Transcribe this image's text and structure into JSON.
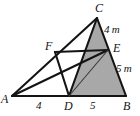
{
  "figure": {
    "type": "geometry-diagram",
    "shape": "triangle-with-cevians",
    "background_color": "#ffffff",
    "stroke_color": "#141414",
    "shaded_fill_color": "#a8a8a8",
    "vertices": [
      {
        "name": "A",
        "label": "A",
        "x": 12,
        "y": 96
      },
      {
        "name": "B",
        "label": "B",
        "x": 126,
        "y": 96
      },
      {
        "name": "C",
        "label": "C",
        "x": 97,
        "y": 18
      },
      {
        "name": "D",
        "label": "D",
        "x": 69,
        "y": 96
      },
      {
        "name": "E",
        "label": "E",
        "x": 108,
        "y": 50
      },
      {
        "name": "F",
        "label": "F",
        "x": 55,
        "y": 52
      }
    ],
    "vertex_labels": [
      {
        "name": "label-C",
        "text": "C",
        "x": 95,
        "y": 2
      },
      {
        "name": "label-F",
        "text": "F",
        "x": 45,
        "y": 40
      },
      {
        "name": "label-E",
        "text": "E",
        "x": 113,
        "y": 42
      },
      {
        "name": "label-A",
        "text": "A",
        "x": 1,
        "y": 93
      },
      {
        "name": "label-D",
        "text": "D",
        "x": 64,
        "y": 100
      },
      {
        "name": "label-B",
        "text": "B",
        "x": 123,
        "y": 100
      }
    ],
    "measure_labels": [
      {
        "name": "label-4m",
        "text": "4 m",
        "x": 104,
        "y": 24
      },
      {
        "name": "label-5m",
        "text": "5 m",
        "x": 116,
        "y": 63
      }
    ],
    "length_labels": [
      {
        "name": "label-segment-AD",
        "text": "4",
        "x": 36,
        "y": 100
      },
      {
        "name": "label-segment-DB",
        "text": "5",
        "x": 90,
        "y": 100
      }
    ],
    "segments": [
      {
        "name": "segment-AB",
        "from": "A",
        "to": "B",
        "weight": "thick"
      },
      {
        "name": "segment-AC",
        "from": "A",
        "to": "C",
        "weight": "thick"
      },
      {
        "name": "segment-CB",
        "from": "C",
        "to": "B",
        "weight": "thick"
      },
      {
        "name": "segment-DC",
        "from": "D",
        "to": "C",
        "weight": "thick"
      },
      {
        "name": "segment-AE",
        "from": "A",
        "to": "E",
        "weight": "thick"
      },
      {
        "name": "segment-FE",
        "from": "F",
        "to": "E",
        "weight": "thick"
      },
      {
        "name": "segment-FD",
        "from": "F",
        "to": "D",
        "weight": "thick"
      },
      {
        "name": "segment-DE",
        "from": "D",
        "to": "E",
        "weight": "thin"
      }
    ],
    "shaded_regions": [
      {
        "name": "region-DCB",
        "polygon": "D,C,B"
      }
    ]
  }
}
